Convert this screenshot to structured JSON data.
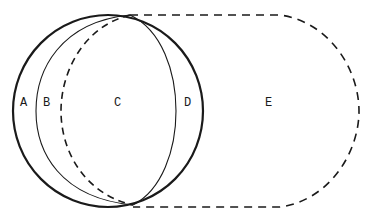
{
  "diagram": {
    "type": "region-diagram",
    "labels": {
      "a": "A",
      "b": "B",
      "c": "C",
      "d": "D",
      "e": "E"
    },
    "colors": {
      "stroke": "#1a1a1a",
      "background": "#ffffff"
    },
    "regions": [
      {
        "id": "A",
        "description": "crescent between outer solid circle and inner thin left arc"
      },
      {
        "id": "B",
        "description": "crescent between thin left arc and dashed left arc"
      },
      {
        "id": "C",
        "description": "lens between dashed left arc and thin right arc"
      },
      {
        "id": "D",
        "description": "crescent between thin right arc and outer solid circle"
      },
      {
        "id": "E",
        "description": "area inside dashed rounded outline, outside solid circle"
      }
    ]
  }
}
